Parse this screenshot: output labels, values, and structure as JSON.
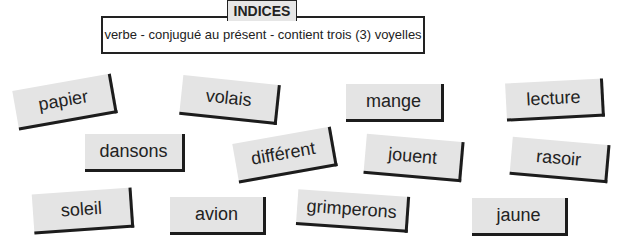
{
  "header": {
    "title": "INDICES",
    "clue": "verbe - conjugué au présent - contient trois (3) voyelles"
  },
  "cards": [
    {
      "word": "papier"
    },
    {
      "word": "volais"
    },
    {
      "word": "mange"
    },
    {
      "word": "lecture"
    },
    {
      "word": "dansons"
    },
    {
      "word": "différent"
    },
    {
      "word": "jouent"
    },
    {
      "word": "rasoir"
    },
    {
      "word": "soleil"
    },
    {
      "word": "avion"
    },
    {
      "word": "grimperons"
    },
    {
      "word": "jaune"
    }
  ],
  "colors": {
    "card_background": "#e4e4e4",
    "card_shadow": "#1c1c1c",
    "text": "#222222"
  }
}
